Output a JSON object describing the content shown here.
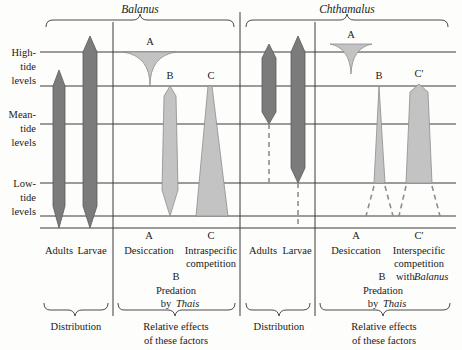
{
  "figure": {
    "title_species_left": "Balanus",
    "title_species_right": "Chthamalus",
    "tide_levels": [
      {
        "id": "high",
        "line1": "High-",
        "line2": "tide",
        "line3": "levels"
      },
      {
        "id": "mean",
        "line1": "Mean-",
        "line2": "tide",
        "line3": "levels"
      },
      {
        "id": "low",
        "line1": "Low-",
        "line2": "tide",
        "line3": "levels"
      }
    ],
    "panels": [
      {
        "id": "balanus-distribution",
        "species": "Balanus",
        "category": "Distribution",
        "bars": [
          {
            "name": "Adults",
            "label": "Adults",
            "style": "dark"
          },
          {
            "name": "Larvae",
            "label": "Larvae",
            "style": "dark"
          }
        ],
        "brace_label": "Distribution"
      },
      {
        "id": "balanus-factors",
        "species": "Balanus",
        "category": "Relative effects of these factors",
        "factors": [
          {
            "key": "A",
            "label": "Desiccation",
            "shape": "funnel"
          },
          {
            "key": "B",
            "label": "Predation by Thais",
            "label_line1": "Predation",
            "label_line2": "by",
            "label_italic": "Thais",
            "shape": "spindle"
          },
          {
            "key": "C",
            "label": "Intraspecific competition",
            "label_line1": "Intraspecific",
            "label_line2": "competition",
            "shape": "wedge-down"
          }
        ],
        "brace_label_line1": "Relative effects",
        "brace_label_line2": "of these factors"
      },
      {
        "id": "chthamalus-distribution",
        "species": "Chthamalus",
        "category": "Distribution",
        "bars": [
          {
            "name": "Adults",
            "label": "Adults",
            "style": "dark"
          },
          {
            "name": "Larvae",
            "label": "Larvae",
            "style": "dark"
          }
        ],
        "brace_label": "Distribution"
      },
      {
        "id": "chthamalus-factors",
        "species": "Chthamalus",
        "category": "Relative effects of these factors",
        "factors": [
          {
            "key": "A",
            "label": "Desiccation",
            "shape": "funnel"
          },
          {
            "key": "B",
            "label": "Predation by Thais",
            "label_line1": "Predation",
            "label_line2": "by",
            "label_italic": "Thais",
            "shape": "triangle"
          },
          {
            "key": "C'",
            "label": "Interspecific competition with Balanus",
            "label_line1": "Interspecific",
            "label_line2": "competition",
            "label_line3": "with",
            "label_italic": "Balanus",
            "shape": "column"
          }
        ],
        "brace_label_line1": "Relative effects",
        "brace_label_line2": "of these factors"
      }
    ],
    "axis_labels_bottom": {
      "adults": "Adults",
      "larvae": "Larvae",
      "desiccation": "Desiccation",
      "intraspecific_l1": "Intraspecific",
      "intraspecific_l2": "competition",
      "interspecific_l1": "Interspecific",
      "interspecific_l2": "competition",
      "interspecific_l3": "with",
      "interspecific_ital": "Balanus",
      "predation_l1": "Predation",
      "predation_l2": "by",
      "predation_ital": "Thais",
      "letter_a": "A",
      "letter_b": "B",
      "letter_c": "C",
      "letter_c_prime": "C'",
      "distribution": "Distribution",
      "relative_l1": "Relative effects",
      "relative_l2": "of these factors"
    },
    "colors": {
      "dark_fill": "#7b7b7b",
      "light_fill": "#c3c3c3",
      "line": "#3a3a3a",
      "dashed": "#8d8d8d",
      "background": "#fdfdfb"
    }
  }
}
